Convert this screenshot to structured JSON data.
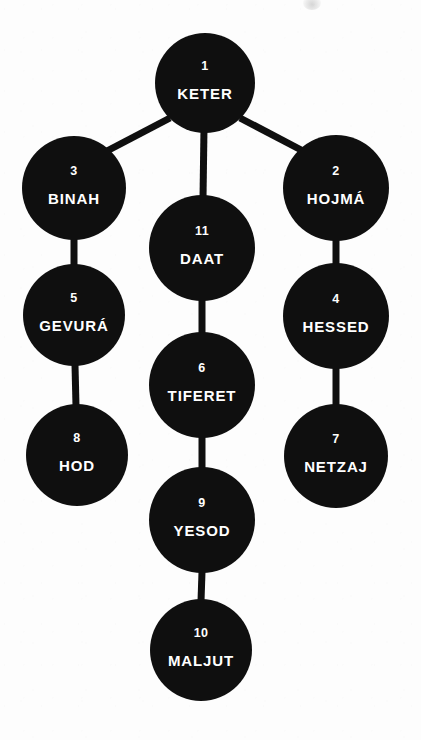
{
  "diagram": {
    "background_color": "#fdfdfd",
    "node_color": "#0f0f0f",
    "text_color": "#ffffff",
    "edge_color": "#0f0f0f"
  },
  "nodes": [
    {
      "id": "keter",
      "number": "1",
      "name": "KETER",
      "cx": 205,
      "cy": 83,
      "r": 50
    },
    {
      "id": "binah",
      "number": "3",
      "name": "BINAH",
      "cx": 74,
      "cy": 188,
      "r": 52
    },
    {
      "id": "hojma",
      "number": "2",
      "name": "HOJMÁ",
      "cx": 336,
      "cy": 188,
      "r": 53
    },
    {
      "id": "daat",
      "number": "11",
      "name": "DAAT",
      "cx": 202,
      "cy": 248,
      "r": 53
    },
    {
      "id": "gevura",
      "number": "5",
      "name": "GEVURÁ",
      "cx": 74,
      "cy": 315,
      "r": 51
    },
    {
      "id": "hessed",
      "number": "4",
      "name": "HESSED",
      "cx": 336,
      "cy": 316,
      "r": 53
    },
    {
      "id": "tiferet",
      "number": "6",
      "name": "TIFERET",
      "cx": 202,
      "cy": 385,
      "r": 53
    },
    {
      "id": "hod",
      "number": "8",
      "name": "HOD",
      "cx": 77,
      "cy": 455,
      "r": 51
    },
    {
      "id": "netzaj",
      "number": "7",
      "name": "NETZAJ",
      "cx": 336,
      "cy": 456,
      "r": 52
    },
    {
      "id": "yesod",
      "number": "9",
      "name": "YESOD",
      "cx": 202,
      "cy": 520,
      "r": 53
    },
    {
      "id": "maljut",
      "number": "10",
      "name": "MALJUT",
      "cx": 201,
      "cy": 650,
      "r": 51
    }
  ],
  "edges": [
    {
      "id": "keter-binah",
      "from": "keter",
      "to": "binah",
      "x1": 170,
      "y1": 118,
      "x2": 105,
      "y2": 152
    },
    {
      "id": "keter-hojma",
      "from": "keter",
      "to": "hojma",
      "x1": 240,
      "y1": 118,
      "x2": 305,
      "y2": 152
    },
    {
      "id": "keter-daat",
      "from": "keter",
      "to": "daat",
      "x1": 204,
      "y1": 128,
      "x2": 203,
      "y2": 198
    },
    {
      "id": "binah-gevura",
      "from": "binah",
      "to": "gevura",
      "x1": 74,
      "y1": 238,
      "x2": 74,
      "y2": 266
    },
    {
      "id": "hojma-hessed",
      "from": "hojma",
      "to": "hessed",
      "x1": 336,
      "y1": 240,
      "x2": 336,
      "y2": 265
    },
    {
      "id": "daat-tiferet",
      "from": "daat",
      "to": "tiferet",
      "x1": 202,
      "y1": 300,
      "x2": 202,
      "y2": 334
    },
    {
      "id": "gevura-hod",
      "from": "gevura",
      "to": "hod",
      "x1": 75,
      "y1": 365,
      "x2": 76,
      "y2": 406
    },
    {
      "id": "hessed-netzaj",
      "from": "hessed",
      "to": "netzaj",
      "x1": 336,
      "y1": 368,
      "x2": 336,
      "y2": 406
    },
    {
      "id": "tiferet-yesod",
      "from": "tiferet",
      "to": "yesod",
      "x1": 202,
      "y1": 437,
      "x2": 202,
      "y2": 469
    },
    {
      "id": "yesod-maljut",
      "from": "yesod",
      "to": "maljut",
      "x1": 202,
      "y1": 572,
      "x2": 201,
      "y2": 601
    }
  ]
}
